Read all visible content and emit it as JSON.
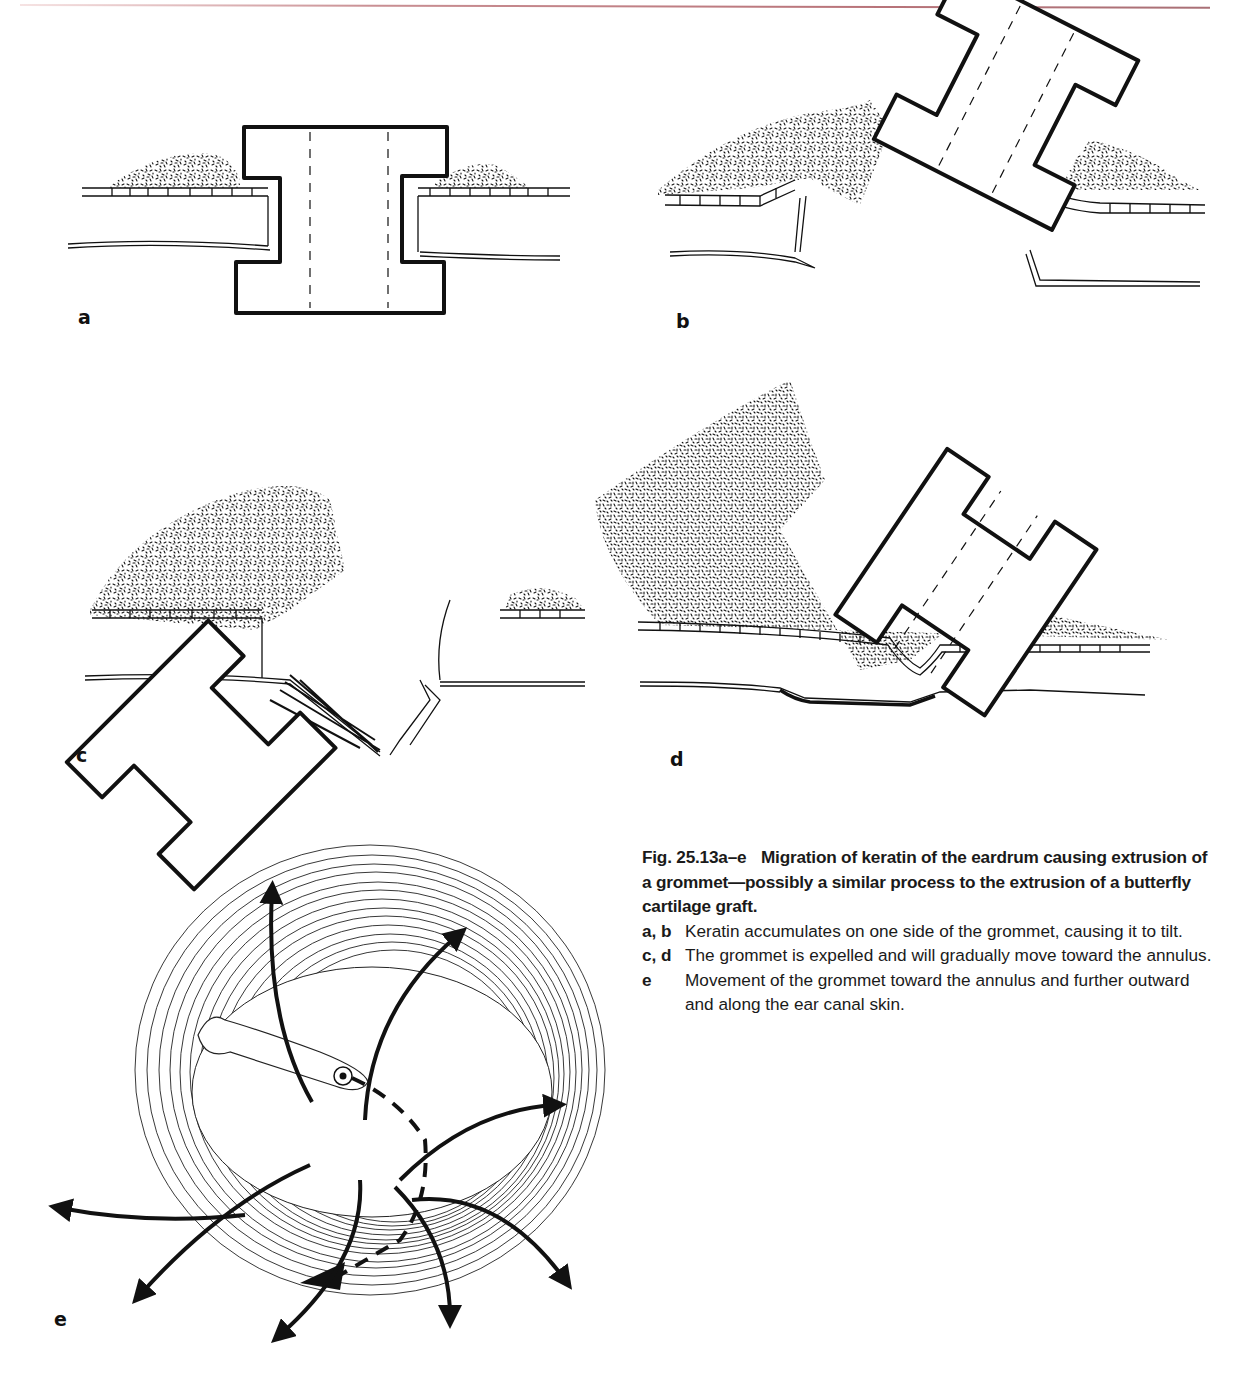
{
  "page": {
    "header_rule_color": "#b9747a"
  },
  "figure": {
    "panels": [
      {
        "id": "a",
        "label": "a",
        "description": "Grommet upright in eardrum with small keratin accumulations on both sides"
      },
      {
        "id": "b",
        "label": "b",
        "description": "Keratin accumulates on one side causing grommet to tilt"
      },
      {
        "id": "c",
        "label": "c",
        "description": "Grommet being expelled, tilted further with large keratin mass"
      },
      {
        "id": "d",
        "label": "d",
        "description": "Grommet pushed outward onto eardrum surface by keratin"
      },
      {
        "id": "e",
        "label": "e",
        "description": "Surface view of eardrum showing radial keratin migration arrows toward annulus"
      }
    ],
    "caption": {
      "fig_number": "Fig. 25.13a–e",
      "title": "Migration of keratin of the eardrum causing extrusion of a grommet—possibly a similar process to the extrusion of a butterfly cartilage graft.",
      "items": [
        {
          "key": "a, b",
          "text": "Keratin accumulates on one side of the grommet, causing it to tilt."
        },
        {
          "key": "c, d",
          "text": "The grommet is expelled and will gradually move toward the annulus."
        },
        {
          "key": "e",
          "text": "Movement of the grommet toward the annulus and further outward and along the ear canal skin."
        }
      ]
    }
  }
}
